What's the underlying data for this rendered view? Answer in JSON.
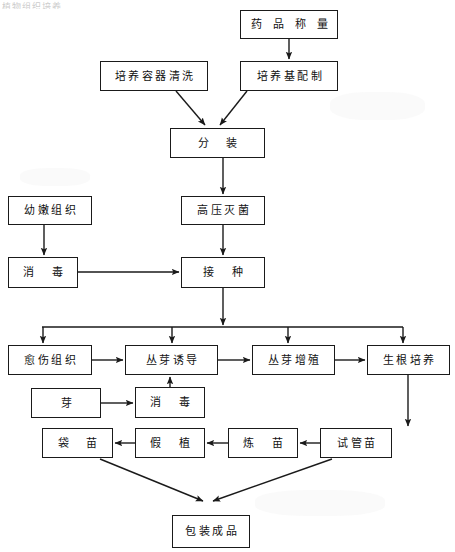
{
  "diagram": {
    "title_fragment": "植物组织培养",
    "type": "flowchart",
    "orientation": "top-to-bottom",
    "line_color": "#1a1a1a",
    "box_fill": "#ffffff",
    "page_background": "#ffffff",
    "nodes": [
      {
        "id": "n1",
        "label": "药品称量",
        "x": 240,
        "y": 10,
        "w": 98,
        "h": 29
      },
      {
        "id": "n2",
        "label": "培养容器清洗",
        "x": 100,
        "y": 61,
        "w": 108,
        "h": 30
      },
      {
        "id": "n3",
        "label": "培养基配制",
        "x": 240,
        "y": 61,
        "w": 98,
        "h": 30
      },
      {
        "id": "n4",
        "label": "分  装",
        "x": 170,
        "y": 128,
        "w": 95,
        "h": 30
      },
      {
        "id": "n5",
        "label": "幼嫩组织",
        "x": 8,
        "y": 196,
        "w": 84,
        "h": 29
      },
      {
        "id": "n6",
        "label": "高压灭菌",
        "x": 181,
        "y": 196,
        "w": 84,
        "h": 29
      },
      {
        "id": "n7",
        "label": "消  毒",
        "x": 8,
        "y": 257,
        "w": 70,
        "h": 31
      },
      {
        "id": "n8",
        "label": "接  种",
        "x": 181,
        "y": 257,
        "w": 84,
        "h": 31
      },
      {
        "id": "n9",
        "label": "愈伤组织",
        "x": 8,
        "y": 345,
        "w": 84,
        "h": 30
      },
      {
        "id": "n10",
        "label": "丛芽诱导",
        "x": 125,
        "y": 345,
        "w": 93,
        "h": 30
      },
      {
        "id": "n11",
        "label": "丛芽增殖",
        "x": 252,
        "y": 345,
        "w": 83,
        "h": 30
      },
      {
        "id": "n12",
        "label": "生根培养",
        "x": 367,
        "y": 345,
        "w": 83,
        "h": 30
      },
      {
        "id": "n13",
        "label": "芽",
        "x": 31,
        "y": 388,
        "w": 70,
        "h": 30
      },
      {
        "id": "n14",
        "label": "消  毒",
        "x": 135,
        "y": 387,
        "w": 70,
        "h": 31
      },
      {
        "id": "n15",
        "label": "袋  苗",
        "x": 42,
        "y": 428,
        "w": 71,
        "h": 30
      },
      {
        "id": "n16",
        "label": "假  植",
        "x": 135,
        "y": 428,
        "w": 70,
        "h": 30
      },
      {
        "id": "n17",
        "label": "炼  苗",
        "x": 228,
        "y": 428,
        "w": 70,
        "h": 30
      },
      {
        "id": "n18",
        "label": "试管苗",
        "x": 320,
        "y": 428,
        "w": 72,
        "h": 30
      },
      {
        "id": "n19",
        "label": "包装成品",
        "x": 172,
        "y": 515,
        "w": 78,
        "h": 33
      }
    ],
    "edges": [
      {
        "from": "药品称量",
        "to": "培养基配制",
        "kind": "vertical-arrow"
      },
      {
        "from": "培养容器清洗",
        "to": "分  装",
        "kind": "diagonal-arrow"
      },
      {
        "from": "培养基配制",
        "to": "分  装",
        "kind": "diagonal-arrow"
      },
      {
        "from": "分  装",
        "to": "高压灭菌",
        "kind": "vertical-arrow"
      },
      {
        "from": "高压灭菌",
        "to": "接  种",
        "kind": "vertical-arrow"
      },
      {
        "from": "幼嫩组织",
        "to": "消  毒",
        "kind": "vertical-arrow"
      },
      {
        "from": "消  毒",
        "to": "接  种",
        "kind": "horizontal-arrow"
      },
      {
        "from": "接  种",
        "to": "愈伤组织",
        "kind": "bus-branch-arrow"
      },
      {
        "from": "接  种",
        "to": "丛芽诱导",
        "kind": "bus-branch-arrow"
      },
      {
        "from": "接  种",
        "to": "丛芽增殖",
        "kind": "bus-branch-arrow"
      },
      {
        "from": "接  种",
        "to": "生根培养",
        "kind": "bus-branch-arrow"
      },
      {
        "from": "愈伤组织",
        "to": "丛芽诱导",
        "kind": "horizontal-arrow"
      },
      {
        "from": "丛芽诱导",
        "to": "丛芽增殖",
        "kind": "horizontal-arrow"
      },
      {
        "from": "丛芽增殖",
        "to": "生根培养",
        "kind": "horizontal-arrow"
      },
      {
        "from": "芽",
        "to": "消  毒",
        "kind": "horizontal-arrow"
      },
      {
        "from": "消  毒",
        "to": "丛芽诱导",
        "kind": "vertical-up-arrow"
      },
      {
        "from": "生根培养",
        "to": "试管苗",
        "kind": "vertical-arrow"
      },
      {
        "from": "试管苗",
        "to": "炼  苗",
        "kind": "horizontal-left-arrow"
      },
      {
        "from": "炼  苗",
        "to": "假  植",
        "kind": "horizontal-left-arrow"
      },
      {
        "from": "假  植",
        "to": "袋  苗",
        "kind": "horizontal-left-arrow"
      },
      {
        "from": "袋  苗",
        "to": "包装成品",
        "kind": "diagonal-arrow"
      },
      {
        "from": "试管苗",
        "to": "包装成品",
        "kind": "diagonal-arrow"
      }
    ]
  }
}
